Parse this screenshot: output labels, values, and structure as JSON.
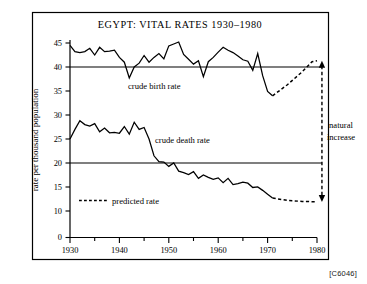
{
  "figure": {
    "code": "[C6046]",
    "title": "EGYPT:  VITAL RATES 1930–1980"
  },
  "chart_data": {
    "type": "line",
    "title": "EGYPT:  VITAL RATES 1930–1980",
    "xlabel": "",
    "ylabel": "rate per thousand population",
    "xlim": [
      1929,
      1982
    ],
    "ylim": [
      0,
      46
    ],
    "grid": false,
    "legend_position": "inline-annotations",
    "y_ticks": [
      0,
      10,
      15,
      20,
      25,
      30,
      35,
      40,
      45
    ],
    "y_tick_labels": [
      "0",
      "10",
      "15",
      "20",
      "25",
      "30",
      "35",
      "40",
      "45"
    ],
    "y_axis_break_between": [
      0,
      10
    ],
    "x_ticks_major": [
      1930,
      1940,
      1950,
      1960,
      1970,
      1980
    ],
    "x_tick_labels": [
      "1930",
      "1940",
      "1950",
      "1960",
      "1970",
      "1980"
    ],
    "x_ticks_minor": [
      1935,
      1945,
      1955,
      1965,
      1975
    ],
    "reference_lines": [
      {
        "name": "birth-reference-line",
        "y": 40,
        "x_from": 1930,
        "x_to": 1981
      },
      {
        "name": "death-reference-line",
        "y": 20,
        "x_from": 1930,
        "x_to": 1981
      }
    ],
    "annotations": [
      {
        "name": "crude-birth-rate-label",
        "text": "crude birth rate",
        "x": 1942.5,
        "y": 37.0
      },
      {
        "name": "crude-death-rate-label",
        "text": "crude death rate",
        "x": 1950.5,
        "y": 25.2
      },
      {
        "name": "predicted-rate-label",
        "text": "predicted rate",
        "x": 1942.0,
        "y": 12.6
      },
      {
        "name": "natural-increase-label-line1",
        "text": "natural",
        "x": 1981.0,
        "y": 28.0
      },
      {
        "name": "natural-increase-label-line2",
        "text": "increase",
        "x": 1981.0,
        "y": 26.2
      }
    ],
    "series": [
      {
        "name": "crude birth rate",
        "style": "solid",
        "x": [
          1930,
          1931,
          1932,
          1933,
          1934,
          1935,
          1936,
          1937,
          1938,
          1939,
          1940,
          1941,
          1942,
          1943,
          1944,
          1945,
          1946,
          1947,
          1948,
          1949,
          1950,
          1951,
          1952,
          1953,
          1954,
          1955,
          1956,
          1957,
          1958,
          1959,
          1960,
          1961,
          1962,
          1963,
          1964,
          1965,
          1966,
          1967,
          1968,
          1969,
          1970,
          1971
        ],
        "values": [
          44.5,
          43.2,
          43.0,
          43.2,
          43.9,
          42.5,
          44.1,
          43.2,
          43.3,
          43.5,
          42.0,
          41.0,
          37.7,
          40.0,
          40.8,
          42.4,
          41.0,
          42.0,
          42.8,
          41.7,
          44.4,
          44.8,
          45.2,
          42.6,
          41.6,
          40.6,
          41.3,
          38.0,
          41.1,
          42.0,
          43.1,
          44.1,
          43.5,
          43.0,
          42.3,
          41.5,
          41.2,
          39.3,
          42.8,
          38.2,
          34.9,
          34.0
        ]
      },
      {
        "name": "predicted birth rate",
        "style": "dashed",
        "x": [
          1971,
          1974,
          1977,
          1979,
          1980
        ],
        "values": [
          34.0,
          36.3,
          39.0,
          41.1,
          41.3
        ]
      },
      {
        "name": "crude death rate",
        "style": "solid",
        "x": [
          1930,
          1931,
          1932,
          1933,
          1934,
          1935,
          1936,
          1937,
          1938,
          1939,
          1940,
          1941,
          1942,
          1943,
          1944,
          1945,
          1946,
          1947,
          1948,
          1949,
          1950,
          1951,
          1952,
          1953,
          1954,
          1955,
          1956,
          1957,
          1958,
          1959,
          1960,
          1961,
          1962,
          1963,
          1964,
          1965,
          1966,
          1967,
          1968,
          1969,
          1970,
          1971
        ],
        "values": [
          25.0,
          27.0,
          28.8,
          28.0,
          27.7,
          28.2,
          26.5,
          27.3,
          26.3,
          26.4,
          26.2,
          27.6,
          26.0,
          28.5,
          27.0,
          27.4,
          25.0,
          21.5,
          20.3,
          20.2,
          19.3,
          20.0,
          18.3,
          18.0,
          17.6,
          18.2,
          16.8,
          17.5,
          17.0,
          16.6,
          16.9,
          15.9,
          16.8,
          15.5,
          15.7,
          16.0,
          15.8,
          14.9,
          15.0,
          14.3,
          13.5,
          12.7
        ]
      },
      {
        "name": "predicted death rate",
        "style": "dashed",
        "x": [
          1971,
          1974,
          1977,
          1980
        ],
        "values": [
          12.7,
          12.2,
          12.0,
          11.9
        ]
      }
    ],
    "natural_increase_marker": {
      "name": "natural-increase-bracket",
      "x": 1981,
      "y_top": 41.3,
      "y_bottom": 11.9,
      "style": "dashed-double-arrow"
    }
  }
}
